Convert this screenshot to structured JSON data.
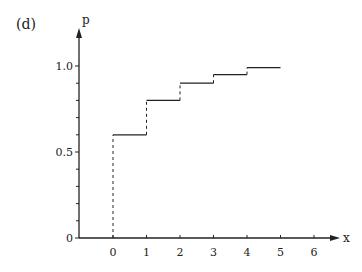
{
  "panel_label": "(d)",
  "chart_data": {
    "type": "line",
    "style": "step-cdf",
    "title": "",
    "xlabel": "x",
    "ylabel": "p",
    "x_ticks": [
      "0",
      "1",
      "2",
      "3",
      "4",
      "5",
      "6"
    ],
    "y_tick_labels": [
      {
        "value": 0,
        "label": "0"
      },
      {
        "value": 0.5,
        "label": "0.5"
      },
      {
        "value": 1.0,
        "label": "1.0"
      }
    ],
    "y_minor_ticks": [
      0.1,
      0.2,
      0.3,
      0.4,
      0.6,
      0.7,
      0.8,
      0.9
    ],
    "xlim": [
      -1.0,
      6.7
    ],
    "ylim": [
      0,
      1.2
    ],
    "grid": false,
    "legend": null,
    "steps": [
      {
        "x_start": 0,
        "x_end": 1,
        "y": 0.6
      },
      {
        "x_start": 1,
        "x_end": 2,
        "y": 0.8
      },
      {
        "x_start": 2,
        "x_end": 3,
        "y": 0.9
      },
      {
        "x_start": 3,
        "x_end": 4,
        "y": 0.95
      },
      {
        "x_start": 4,
        "x_end": 5,
        "y": 0.99
      }
    ],
    "jumps_dashed": [
      {
        "x": 0,
        "from": 0,
        "to": 0.6
      },
      {
        "x": 1,
        "from": 0.6,
        "to": 0.8
      },
      {
        "x": 2,
        "from": 0.8,
        "to": 0.9
      },
      {
        "x": 3,
        "from": 0.9,
        "to": 0.95
      },
      {
        "x": 4,
        "from": 0.95,
        "to": 0.99
      }
    ]
  },
  "colors": {
    "line": "#222222",
    "background": "#ffffff"
  }
}
